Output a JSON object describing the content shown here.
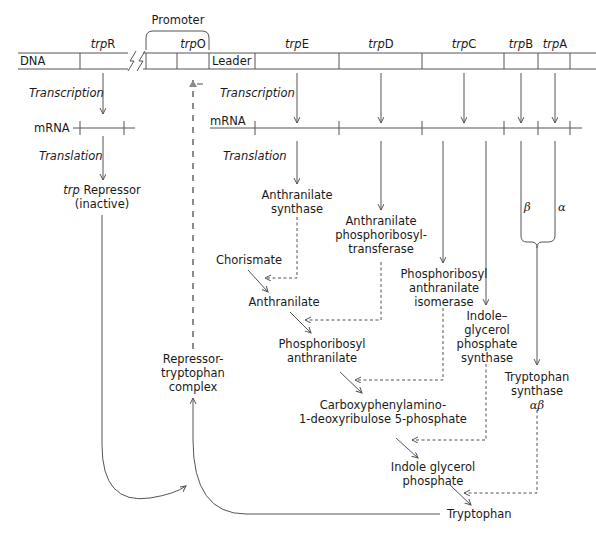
{
  "dna": {
    "label": "DNA",
    "promoter_label": "Promoter",
    "leader_label": "Leader",
    "genes": [
      {
        "prefix": "trp",
        "suffix": "R"
      },
      {
        "prefix": "trp",
        "suffix": "O"
      },
      {
        "prefix": "trp",
        "suffix": "E"
      },
      {
        "prefix": "trp",
        "suffix": "D"
      },
      {
        "prefix": "trp",
        "suffix": "C"
      },
      {
        "prefix": "trp",
        "suffix": "B"
      },
      {
        "prefix": "trp",
        "suffix": "A"
      }
    ]
  },
  "left": {
    "transcription": "Transcription",
    "mrna": "mRNA",
    "translation": "Translation",
    "repressor_prefix": "trp",
    "repressor_line1": " Repressor",
    "repressor_line2": "(inactive)",
    "complex_line1": "Repressor-",
    "complex_line2": "tryptophan",
    "complex_line3": "complex"
  },
  "right": {
    "transcription": "Transcription",
    "mrna": "mRNA",
    "translation": "Translation"
  },
  "enzymes": {
    "e1_line1": "Anthranilate",
    "e1_line2": "synthase",
    "e2_line1": "Anthranilate",
    "e2_line2": "phosphoribosyl-",
    "e2_line3": "transferase",
    "e3_line1": "Phosphoribosyl",
    "e3_line2": "anthranilate",
    "e3_line3": "isomerase",
    "e4_line1": "Indole–",
    "e4_line2": "glycerol",
    "e4_line3": "phosphate",
    "e4_line4": "synthase",
    "beta": "β",
    "alpha": "α",
    "e5_line1": "Tryptophan",
    "e5_line2": "synthase",
    "e5_line3": "αβ"
  },
  "metabolites": {
    "chorismate": "Chorismate",
    "anthranilate": "Anthranilate",
    "pra_line1": "Phosphoribosyl",
    "pra_line2": "anthranilate",
    "cdrp_line1": "Carboxyphenylamino-",
    "cdrp_line2": "1-deoxyribulose 5-phosphate",
    "igp_line1": "Indole glycerol",
    "igp_line2": "phosphate",
    "tryptophan": "Tryptophan"
  },
  "feedback": {
    "sign": "–"
  },
  "colors": {
    "line": "#555555",
    "dashed_feedback": "#8a8a8a",
    "text": "#1a1a1a"
  }
}
